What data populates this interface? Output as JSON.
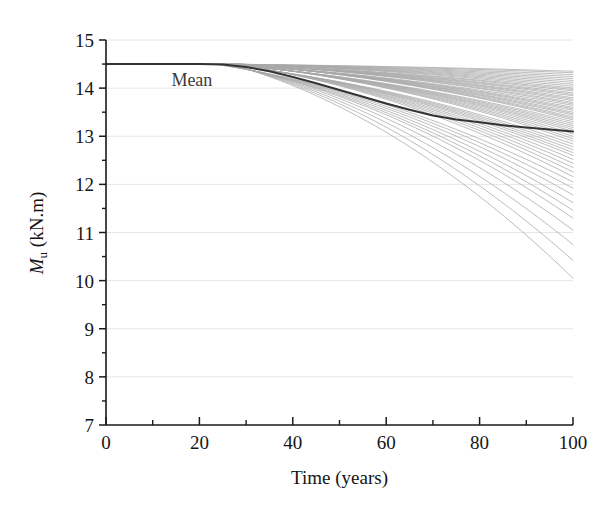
{
  "figure": {
    "width": 615,
    "height": 508,
    "background": "#ffffff"
  },
  "chart_data": {
    "type": "line",
    "title": "",
    "subtitle": "",
    "xlabel": "Time (years)",
    "ylabel": "Mu (kN.m)",
    "ylabel_base": "M",
    "ylabel_sub": "u",
    "ylabel_unit": " (kN.m)",
    "xlim": [
      0,
      100
    ],
    "ylim": [
      7,
      15
    ],
    "xticks": [
      0,
      20,
      40,
      60,
      80,
      100
    ],
    "xtick_labels": [
      "0",
      "20",
      "40",
      "60",
      "80",
      "100"
    ],
    "xminor_ticks": [
      10,
      30,
      50,
      70,
      90
    ],
    "yticks": [
      7,
      8,
      9,
      10,
      11,
      12,
      13,
      14,
      15
    ],
    "ytick_labels": [
      "7",
      "8",
      "9",
      "10",
      "11",
      "12",
      "13",
      "14",
      "15"
    ],
    "yminor_ticks": [
      7.5,
      8.5,
      9.5,
      10.5,
      11.5,
      12.5,
      13.5,
      14.5
    ],
    "grid": true,
    "grid_axis": "y",
    "grid_color": "#e6e6e6",
    "legend": "none",
    "annotations": [
      {
        "text": "Mean",
        "x": 14,
        "y": 14.18,
        "color": "#3a3a3a"
      }
    ],
    "axis_color": "#1a1a1a",
    "realization_color": "#a8a8a8",
    "mean_color": "#333333",
    "initial_value": 14.5,
    "onset_year": 25,
    "n_realizations": 60,
    "mean_series": {
      "name": "Mean",
      "x": [
        0,
        5,
        10,
        15,
        20,
        25,
        30,
        35,
        40,
        45,
        50,
        55,
        60,
        65,
        70,
        75,
        80,
        85,
        90,
        95,
        100
      ],
      "y": [
        14.5,
        14.5,
        14.5,
        14.5,
        14.5,
        14.49,
        14.44,
        14.35,
        14.23,
        14.1,
        13.96,
        13.82,
        13.68,
        13.55,
        13.43,
        13.35,
        13.29,
        13.23,
        13.18,
        13.14,
        13.1
      ]
    },
    "realization_endpoints_at_100": [
      14.35,
      14.32,
      14.28,
      14.24,
      14.2,
      14.16,
      14.12,
      14.08,
      14.04,
      14.0,
      13.97,
      13.94,
      13.9,
      13.87,
      13.84,
      13.8,
      13.77,
      13.74,
      13.7,
      13.67,
      13.64,
      13.6,
      13.57,
      13.54,
      13.5,
      13.47,
      13.44,
      13.4,
      13.37,
      13.34,
      13.3,
      13.26,
      13.22,
      13.18,
      13.14,
      13.1,
      13.05,
      13.0,
      12.95,
      12.9,
      12.84,
      12.78,
      12.72,
      12.66,
      12.6,
      12.52,
      12.44,
      12.35,
      12.26,
      12.16,
      12.05,
      11.92,
      11.78,
      11.62,
      11.46,
      11.3,
      11.05,
      10.75,
      10.42,
      10.05
    ],
    "realization_onsets": [
      24.0,
      24.4,
      24.8,
      25.2,
      25.6,
      26.0,
      26.4,
      26.8,
      27.2,
      27.6,
      24.2,
      24.6,
      25.0,
      25.4,
      25.8,
      26.2,
      26.6,
      27.0,
      27.4,
      27.8,
      24.1,
      24.5,
      24.9,
      25.3,
      25.7,
      26.1,
      26.5,
      26.9,
      27.3,
      27.7,
      23.8,
      24.3,
      24.7,
      25.1,
      25.5,
      25.9,
      26.3,
      26.7,
      27.1,
      27.5,
      23.5,
      24.0,
      24.4,
      24.9,
      25.3,
      25.7,
      26.1,
      26.6,
      27.0,
      27.4,
      23.0,
      23.4,
      23.8,
      24.2,
      24.6,
      25.0,
      25.4,
      25.8,
      26.2,
      26.6
    ]
  },
  "plot_geometry": {
    "left": 106,
    "right": 573,
    "top": 40,
    "bottom": 425
  }
}
